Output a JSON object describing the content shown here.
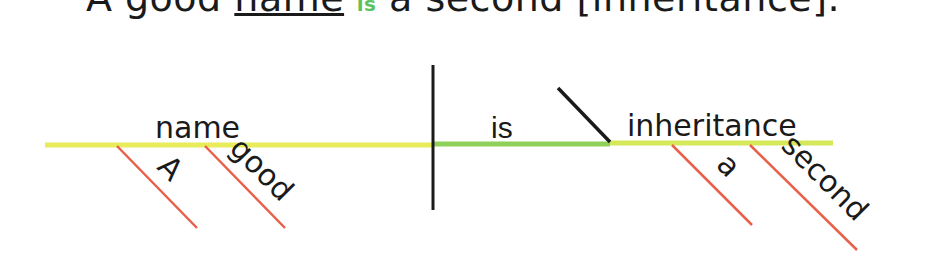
{
  "sentence": {
    "part1": "A good ",
    "subject": "name",
    "verb": "is",
    "part2": " a second [inheritance]."
  },
  "diagram": {
    "subject": "name",
    "verb": "is",
    "predicate_nominative": "inheritance",
    "subject_modifiers": [
      "A",
      "good"
    ],
    "predicate_modifiers": [
      "a",
      "second"
    ],
    "colors": {
      "subject_baseline": "#e8ec5a",
      "verb_baseline": "#8fd05a",
      "predicate_baseline": "#c9e45a",
      "modifier_lines": "#e8604a",
      "divider_lines": "#1a1a1a",
      "text": "#1a1a1a",
      "verb_highlight": "#5cc35c"
    }
  }
}
